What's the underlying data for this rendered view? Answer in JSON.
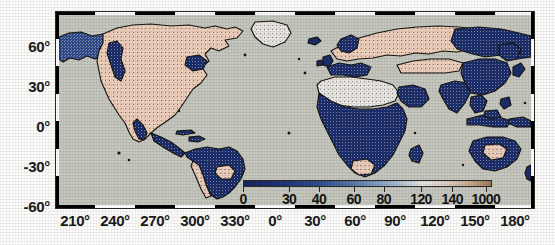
{
  "figure": {
    "kind": "global-map",
    "background_color": "#fdfdfb",
    "ocean_color": "#c6c7be",
    "coastline_color": "#1b1b17",
    "frame_style": "checkered-black-white"
  },
  "chart_data": {
    "type": "heatmap",
    "title": "",
    "subtitle": "",
    "xlabel": "",
    "ylabel": "",
    "projection": "equirectangular",
    "grid": false,
    "legend_position": "inside-bottom-right",
    "xlim": [
      195,
      185
    ],
    "ylim": [
      -65,
      79
    ],
    "x_tick_values": [
      210,
      240,
      270,
      300,
      330,
      0,
      30,
      60,
      90,
      120,
      150,
      180
    ],
    "x_tick_labels": [
      "210°",
      "240°",
      "270°",
      "300°",
      "330°",
      "0°",
      "30°",
      "60°",
      "90°",
      "120°",
      "150°",
      "180°"
    ],
    "y_tick_values": [
      60,
      30,
      0,
      -30,
      -60
    ],
    "y_tick_labels": [
      "60°",
      "30°",
      "0°",
      "-30°",
      "-60°"
    ],
    "colorbar": {
      "tick_labels": [
        "0",
        "30",
        "40",
        "60",
        "80",
        "120",
        "140",
        "1000"
      ],
      "tick_positions_pct": [
        0,
        18.5,
        30.5,
        44.5,
        56.5,
        71.5,
        84.0,
        97.5
      ],
      "scale": "non-linear",
      "stops": [
        {
          "pos_pct": 0,
          "color": "#18275f"
        },
        {
          "pos_pct": 14,
          "color": "#1d3173"
        },
        {
          "pos_pct": 30,
          "color": "#2f4f8e"
        },
        {
          "pos_pct": 46,
          "color": "#5f80ad"
        },
        {
          "pos_pct": 60,
          "color": "#9db6cd"
        },
        {
          "pos_pct": 72,
          "color": "#e6e6e0"
        },
        {
          "pos_pct": 82,
          "color": "#ddd2c4"
        },
        {
          "pos_pct": 92,
          "color": "#c7a98c"
        },
        {
          "pos_pct": 100,
          "color": "#9d7a5c"
        }
      ]
    },
    "value_classes": [
      {
        "name": "low",
        "color": "#1b2d6b",
        "label_range": "0-40"
      },
      {
        "name": "mid-low",
        "color": "#3f63a0",
        "label_range": "40-80"
      },
      {
        "name": "mid",
        "color": "#9fb8cf",
        "label_range": "80-120"
      },
      {
        "name": "mid-high",
        "color": "#efe8e0",
        "label_range": "120-140"
      },
      {
        "name": "high",
        "color": "#f3cbb8",
        "label_range": "140-1000"
      }
    ],
    "regions": [
      {
        "name": "North America",
        "dominant_class": "high",
        "note": "pale pink/tan interior with dark blue patches along west coast and Rockies"
      },
      {
        "name": "Greenland",
        "dominant_class": "mid-high",
        "note": "sparse"
      },
      {
        "name": "South America",
        "dominant_class": "low",
        "note": "Amazon basin strongly dark blue; Andes and far south pale"
      },
      {
        "name": "Europe",
        "dominant_class": "high",
        "note": "pale pink over eastern Europe and western Russia"
      },
      {
        "name": "Africa",
        "dominant_class": "low",
        "note": "nearly entirely dark blue; South Africa pale"
      },
      {
        "name": "Asia",
        "dominant_class": "low",
        "note": "dark blue over Siberia, India, China, SE Asia"
      },
      {
        "name": "Australia",
        "dominant_class": "low",
        "note": "blue margins, pale interior"
      },
      {
        "name": "Ocean",
        "dominant_class": "nodata",
        "note": "uniform gray, no data"
      }
    ]
  }
}
